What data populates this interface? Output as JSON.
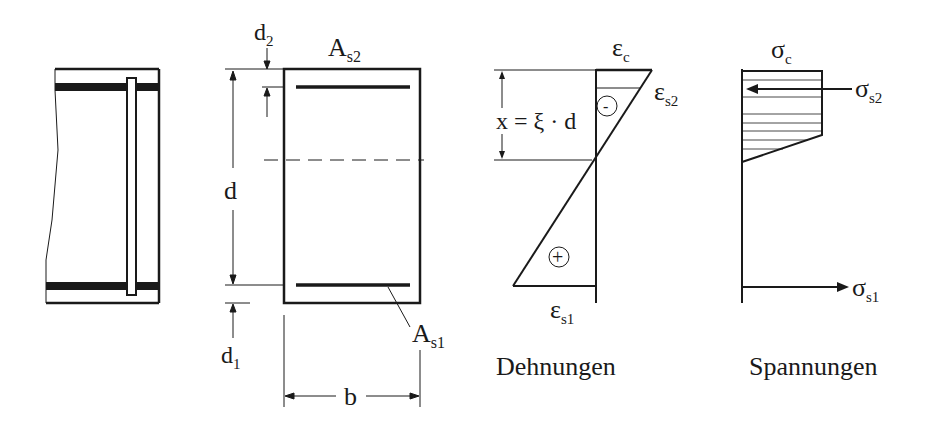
{
  "labels": {
    "d2_main": "d",
    "d2_sub": "2",
    "d1_main": "d",
    "d1_sub": "1",
    "d": "d",
    "b": "b",
    "As2_main": "A",
    "As2_sub": "s2",
    "As1_main": "A",
    "As1_sub": "s1",
    "x_eq": "x = ξ · d",
    "eps_c_main": "ε",
    "eps_c_sub": "c",
    "eps_s2_main": "ε",
    "eps_s2_sub": "s2",
    "eps_s1_main": "ε",
    "eps_s1_sub": "s1",
    "minus": "-",
    "plus": "+",
    "sigma_c_main": "σ",
    "sigma_c_sub": "c",
    "sigma_s2_main": "σ",
    "sigma_s2_sub": "s2",
    "sigma_s1_main": "σ",
    "sigma_s1_sub": "s1",
    "strain_title": "Dehnungen",
    "stress_title": "Spannungen"
  },
  "colors": {
    "ink": "#1a1a1a",
    "background": "#ffffff"
  }
}
